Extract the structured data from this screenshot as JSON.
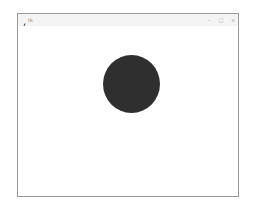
{
  "window": {
    "title": "tk",
    "icon": "feather-icon",
    "controls": {
      "minimize": "–",
      "maximize": "□",
      "close": "×"
    }
  },
  "canvas": {
    "background": "#ffffff",
    "shapes": [
      {
        "type": "oval",
        "fill": "#2f2f2f"
      }
    ]
  }
}
